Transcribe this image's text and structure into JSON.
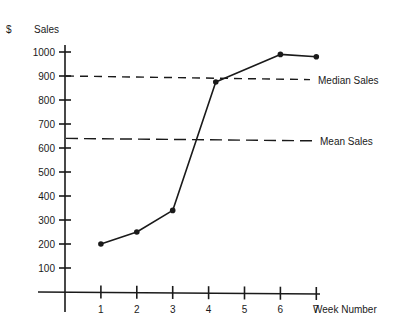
{
  "chart_data": {
    "type": "line",
    "title": "",
    "ylabel_prefix": "$",
    "ylabel": "Sales",
    "xlabel": "Week Number",
    "x_ticks": [
      1,
      2,
      3,
      4,
      5,
      6,
      7
    ],
    "y_ticks": [
      100,
      200,
      300,
      400,
      500,
      600,
      700,
      800,
      900,
      1000
    ],
    "xlim": [
      0,
      7.5
    ],
    "ylim": [
      0,
      1000
    ],
    "grid": false,
    "series": [
      {
        "name": "Sales",
        "x": [
          1,
          2,
          3,
          4.2,
          6,
          7
        ],
        "y": [
          200,
          250,
          340,
          875,
          990,
          980
        ],
        "color": "#1a1a1a",
        "markers": true
      }
    ],
    "reference_lines": [
      {
        "name": "Median Sales",
        "label": "Median Sales",
        "y_start": 900,
        "y_end": 885,
        "style": "short-dash"
      },
      {
        "name": "Mean Sales",
        "label": "Mean Sales",
        "y_start": 640,
        "y_end": 630,
        "style": "long-dash"
      }
    ]
  }
}
